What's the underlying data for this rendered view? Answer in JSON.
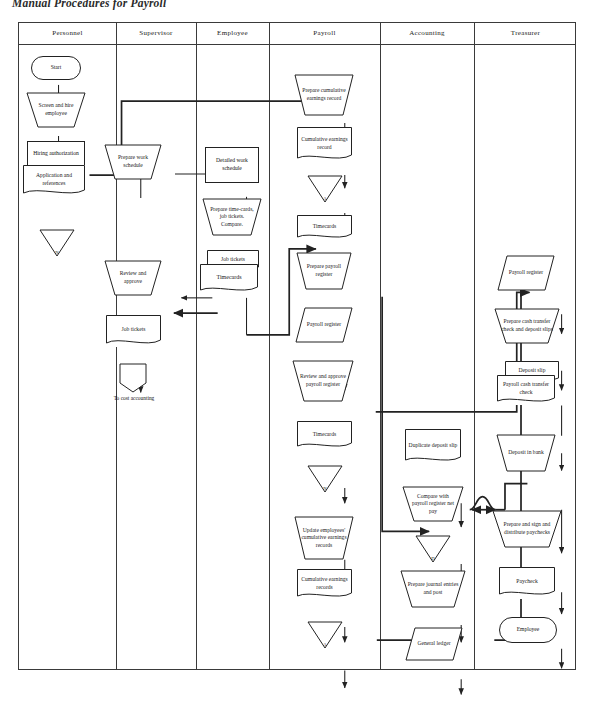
{
  "title": "Manual Procedures for Payroll",
  "columns": [
    {
      "id": "personnel",
      "label": "Personnel"
    },
    {
      "id": "supervisor",
      "label": "Supervisor"
    },
    {
      "id": "employee",
      "label": "Employee"
    },
    {
      "id": "payroll",
      "label": "Payroll"
    },
    {
      "id": "accounting",
      "label": "Accounting"
    },
    {
      "id": "treasurer",
      "label": "Treasurer"
    }
  ],
  "nodes": {
    "start": "Start",
    "screen_hire": "Screen and hire employee",
    "hiring_auth": "Hiring authorization",
    "application_refs": "Application and references",
    "file_personnel": "N",
    "prepare_work_schedule": "Prepare work schedule",
    "review_approve": "Review and approve",
    "job_tickets_sup": "Job tickets",
    "to_cost_accounting": "To cost accounting",
    "detailed_work_schedule": "Detailed work schedule",
    "prepare_timecards": "Prepare time-cards, job tickets. Compare.",
    "job_tickets_emp": "Job tickets",
    "timecards_emp": "Timecards",
    "prepare_cumulative": "Prepare cumulative earnings record",
    "cumulative_record": "Cumulative earnings record",
    "file_payroll_a": "A",
    "timecards_payroll": "Timecards",
    "prepare_payroll_register": "Prepare payroll register",
    "payroll_register": "Payroll register",
    "review_approve_register": "Review and approve payroll register",
    "timecards_payroll2": "Timecards",
    "file_payroll_b": "N",
    "update_cumulative": "Update employees' cumulative earnings records",
    "cumulative_records2": "Cumulative earnings records",
    "file_payroll_c": "A",
    "duplicate_deposit_slip": "Duplicate deposit slip",
    "compare_payroll": "Compare with payroll register net pay",
    "file_accounting": "D",
    "prepare_journal": "Prepare journal entries and post",
    "general_ledger": "General ledger",
    "payroll_register_treas": "Payroll register",
    "prepare_cash_transfer": "Prepare cash transfer check and deposit slips",
    "deposit_slip": "Deposit slip",
    "transfer_check": "Payroll cash transfer check",
    "deposit_in_bank": "Deposit in bank",
    "prepare_sign_distribute": "Prepare and sign and distribute paychecks",
    "paycheck": "Paycheck",
    "employee_end": "Employee"
  },
  "colors": {
    "line": "#222222",
    "frame": "#3a3a3a",
    "paper": "#ffffff"
  }
}
